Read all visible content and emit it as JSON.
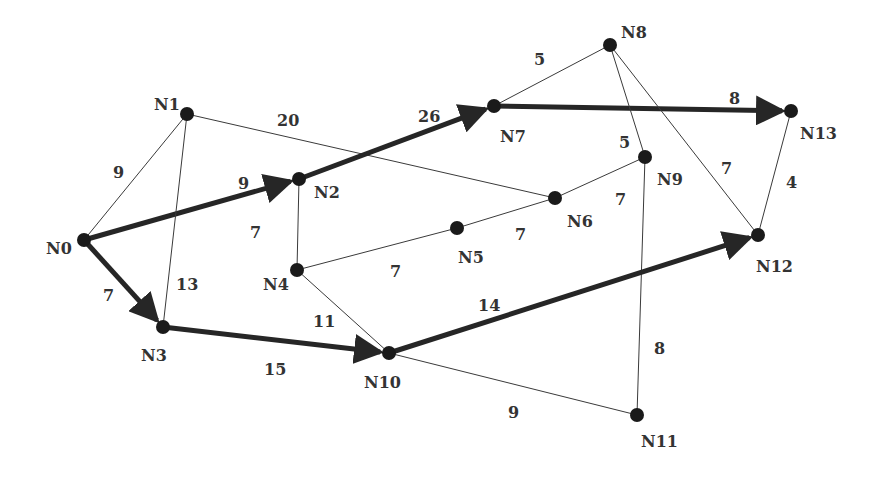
{
  "diagram": {
    "type": "weighted-graph",
    "colors": {
      "node": "#1a1a1a",
      "edge": "#3a3a3a",
      "path": "#262626",
      "text": "#333333"
    },
    "nodes": [
      {
        "id": "N0",
        "x": 84,
        "y": 240,
        "label": "N0",
        "lx": 46,
        "ly": 254
      },
      {
        "id": "N1",
        "x": 187,
        "y": 114,
        "label": "N1",
        "lx": 154,
        "ly": 110
      },
      {
        "id": "N2",
        "x": 299,
        "y": 179,
        "label": "N2",
        "lx": 314,
        "ly": 198
      },
      {
        "id": "N3",
        "x": 163,
        "y": 327,
        "label": "N3",
        "lx": 141,
        "ly": 361
      },
      {
        "id": "N4",
        "x": 297,
        "y": 270,
        "label": "N4",
        "lx": 263,
        "ly": 290
      },
      {
        "id": "N5",
        "x": 457,
        "y": 228,
        "label": "N5",
        "lx": 458,
        "ly": 263
      },
      {
        "id": "N6",
        "x": 555,
        "y": 198,
        "label": "N6",
        "lx": 567,
        "ly": 227
      },
      {
        "id": "N7",
        "x": 494,
        "y": 106,
        "label": "N7",
        "lx": 500,
        "ly": 142
      },
      {
        "id": "N8",
        "x": 610,
        "y": 45,
        "label": "N8",
        "lx": 621,
        "ly": 38
      },
      {
        "id": "N9",
        "x": 645,
        "y": 157,
        "label": "N9",
        "lx": 657,
        "ly": 185
      },
      {
        "id": "N10",
        "x": 389,
        "y": 353,
        "label": "N10",
        "lx": 364,
        "ly": 388
      },
      {
        "id": "N11",
        "x": 637,
        "y": 415,
        "label": "N11",
        "lx": 641,
        "ly": 447
      },
      {
        "id": "N12",
        "x": 758,
        "y": 235,
        "label": "N12",
        "lx": 756,
        "ly": 272
      },
      {
        "id": "N13",
        "x": 791,
        "y": 111,
        "label": "N13",
        "lx": 800,
        "ly": 139
      }
    ],
    "edges": [
      {
        "from": "N0",
        "to": "N1",
        "weight": "9",
        "bold": false,
        "wx": 113,
        "wy": 178
      },
      {
        "from": "N0",
        "to": "N2",
        "weight": "9",
        "bold": true,
        "wx": 238,
        "wy": 189
      },
      {
        "from": "N0",
        "to": "N3",
        "weight": "7",
        "bold": true,
        "wx": 103,
        "wy": 301
      },
      {
        "from": "N1",
        "to": "N3",
        "weight": "13",
        "bold": false,
        "wx": 176,
        "wy": 290
      },
      {
        "from": "N1",
        "to": "N6",
        "weight": "20",
        "bold": false,
        "wx": 277,
        "wy": 126
      },
      {
        "from": "N2",
        "to": "N4",
        "weight": "7",
        "bold": false,
        "wx": 250,
        "wy": 238
      },
      {
        "from": "N2",
        "to": "N7",
        "weight": "26",
        "bold": true,
        "wx": 418,
        "wy": 122
      },
      {
        "from": "N3",
        "to": "N10",
        "weight": "15",
        "bold": true,
        "wx": 264,
        "wy": 375
      },
      {
        "from": "N4",
        "to": "N5",
        "weight": "7",
        "bold": false,
        "wx": 390,
        "wy": 277
      },
      {
        "from": "N4",
        "to": "N10",
        "weight": "11",
        "bold": false,
        "wx": 313,
        "wy": 327
      },
      {
        "from": "N5",
        "to": "N6",
        "weight": "7",
        "bold": false,
        "wx": 515,
        "wy": 240
      },
      {
        "from": "N6",
        "to": "N9",
        "weight": "7",
        "bold": false,
        "wx": 615,
        "wy": 205
      },
      {
        "from": "N7",
        "to": "N8",
        "weight": "5",
        "bold": false,
        "wx": 534,
        "wy": 65
      },
      {
        "from": "N7",
        "to": "N13",
        "weight": "8",
        "bold": true,
        "wx": 729,
        "wy": 104
      },
      {
        "from": "N8",
        "to": "N9",
        "weight": "5",
        "bold": false,
        "wx": 619,
        "wy": 148
      },
      {
        "from": "N8",
        "to": "N12",
        "weight": "7",
        "bold": false,
        "wx": 721,
        "wy": 174
      },
      {
        "from": "N9",
        "to": "N11",
        "weight": "8",
        "bold": false,
        "wx": 654,
        "wy": 354
      },
      {
        "from": "N10",
        "to": "N11",
        "weight": "9",
        "bold": false,
        "wx": 508,
        "wy": 418
      },
      {
        "from": "N10",
        "to": "N12",
        "weight": "14",
        "bold": true,
        "wx": 478,
        "wy": 311
      },
      {
        "from": "N12",
        "to": "N13",
        "weight": "4",
        "bold": false,
        "wx": 786,
        "wy": 188
      }
    ]
  }
}
